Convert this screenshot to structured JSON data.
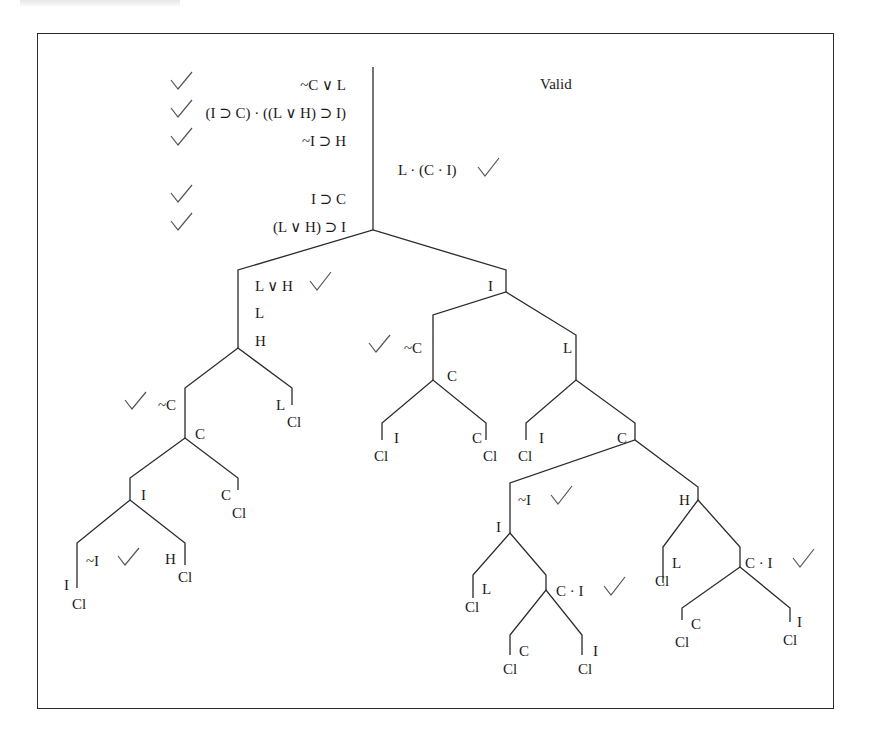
{
  "diagram": {
    "type": "truth-tree",
    "verdict": "Valid",
    "premises": [
      {
        "text": "~C ∨ L",
        "checked": true
      },
      {
        "text": "(I ⊃ C) · ((L ∨ H) ⊃ I)",
        "checked": true
      },
      {
        "text": "~I ⊃ H",
        "checked": true
      },
      {
        "text": "I ⊃ C",
        "checked": true
      },
      {
        "text": "(L ∨ H) ⊃ I",
        "checked": true
      }
    ],
    "negated_conclusion": {
      "text": "L · (C · I)",
      "checked": true
    },
    "nodes": {
      "lvh": "L ∨ H",
      "l_left": "L",
      "h_left": "H",
      "notc_left": "~C",
      "l_leaf": "L",
      "c_left": "C",
      "i_left": "I",
      "c_leaf_left": "C",
      "noti_left": "~I",
      "h_leaf_left": "H",
      "i_leaf_left": "I",
      "i_right": "I",
      "notc_mid": "~C",
      "l_right": "L",
      "c_mid": "C",
      "i_mid_leaf": "I",
      "c_mid_leaf": "C",
      "i_right_leaf": "I",
      "c_right": "C",
      "noti_right": "~I",
      "i_deep": "I",
      "l_deep": "L",
      "ci_deep": "C · I",
      "c_deep_leaf": "C",
      "i_deep_leaf": "I",
      "h_right": "H",
      "l_far": "L",
      "ci_far": "C · I",
      "c_far_leaf": "C",
      "i_far_leaf": "I"
    },
    "closed_label": "Cl"
  },
  "colors": {
    "ink": "#1a1a1a",
    "check": "#555555",
    "frame": "#2a2a2a"
  }
}
